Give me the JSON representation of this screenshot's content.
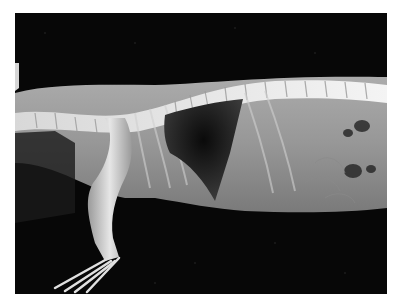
{
  "image": {
    "subject": "lateral radiograph of small animal (thorax and abdomen)",
    "background_color": "#ffffff",
    "film_color": "#070707",
    "bone_color": "#e8e8e8",
    "soft_tissue_color": "#b4b4b4",
    "lung_color": "#151515"
  }
}
